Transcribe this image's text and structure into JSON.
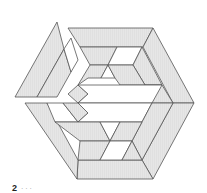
{
  "figure": {
    "colors": {
      "tile_fill": "#e6e6e6",
      "hatch": "#d2d2d2",
      "stroke": "#555555",
      "empty": "#ffffff"
    }
  },
  "caption": {
    "number": "2",
    "text": "· · ·"
  }
}
